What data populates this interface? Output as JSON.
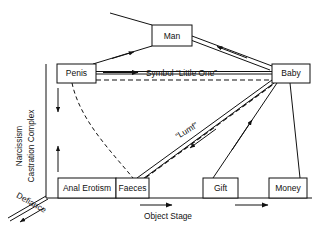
{
  "diagram": {
    "background_color": "#ffffff",
    "line_color": "#111111",
    "nodes": [
      {
        "id": "man",
        "label": "Man",
        "x": 152,
        "y": 25,
        "w": 40,
        "h": 21
      },
      {
        "id": "penis",
        "label": "Penis",
        "x": 57,
        "y": 64,
        "w": 39,
        "h": 19
      },
      {
        "id": "baby",
        "label": "Baby",
        "x": 272,
        "y": 64,
        "w": 38,
        "h": 19
      },
      {
        "id": "anal_erotism",
        "label": "Anal Erotism",
        "x": 58,
        "y": 178,
        "w": 58,
        "h": 20
      },
      {
        "id": "faeces",
        "label": "Faeces",
        "x": 116,
        "y": 178,
        "w": 33,
        "h": 20
      },
      {
        "id": "gift",
        "label": "Gift",
        "x": 203,
        "y": 178,
        "w": 35,
        "h": 20
      },
      {
        "id": "money",
        "label": "Money",
        "x": 269,
        "y": 178,
        "w": 38,
        "h": 20
      }
    ],
    "edge_labels": [
      {
        "id": "symbol_little_one",
        "text": "Symbol “Little One”",
        "x": 146,
        "y": 73
      },
      {
        "id": "lumf",
        "text": "“Lumf”",
        "x": 188,
        "y": 133,
        "rotation": -31
      }
    ],
    "axis_labels": [
      {
        "id": "narcissism",
        "text": "Narcissism",
        "x": 22,
        "y": 146,
        "rotation": -90
      },
      {
        "id": "castration_complex",
        "text": "Castration Complex",
        "x": 33,
        "y": 146,
        "rotation": -90
      },
      {
        "id": "defiance",
        "text": "Defiance",
        "x": 30,
        "y": 205,
        "rotation": 29
      },
      {
        "id": "object_stage",
        "text": "Object Stage",
        "x": 168,
        "y": 216
      }
    ]
  }
}
